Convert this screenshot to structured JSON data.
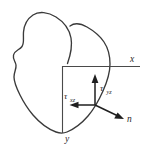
{
  "figure": {
    "background_color": "#ffffff",
    "outline_color": "#3a3a3a",
    "axis_color": "#4a4a4a",
    "vector_color": "#1f1f1f",
    "label_color": "#2b2b2b",
    "width": 149,
    "height": 154
  },
  "axes": {
    "x_label": "x",
    "y_label": "y",
    "origin": {
      "x": 62,
      "y": 66
    },
    "x_axis_end": {
      "x": 140,
      "y": 66
    },
    "y_axis_end": {
      "x": 62,
      "y": 133
    }
  },
  "vectors": [
    {
      "name": "normal-vector",
      "label": "n",
      "label_sub": "",
      "direction": "down-right",
      "from": {
        "x": 95,
        "y": 105
      },
      "to": {
        "x": 124,
        "y": 119
      }
    },
    {
      "name": "tau-yz-vector",
      "label": "τ",
      "label_sub": "yz",
      "direction": "up",
      "from": {
        "x": 95,
        "y": 105
      },
      "to": {
        "x": 95,
        "y": 76
      }
    },
    {
      "name": "tau-xz-vector",
      "label": "τ",
      "label_sub": "xz",
      "direction": "left",
      "from": {
        "x": 95,
        "y": 105
      },
      "to": {
        "x": 70,
        "y": 105
      }
    }
  ],
  "labels": {
    "x": "x",
    "y": "y",
    "n": "n",
    "tau_glyph": "τ",
    "tau_yz_sub": "yz",
    "tau_xz_sub": "xz"
  },
  "shapes": {
    "blob_name": "cross-section-outline",
    "blob_path": "M 68 64 C 70 52 72 40 66 30 C 60 20 50 12 40 14 C 30 16 24 24 22 32 C 20 40 22 46 20 50 C 18 53 14 54 13 58 C 12 62 15 64 16 68 C 17 74 14 78 14 84 C 14 92 18 98 22 104 C 26 110 31 116 38 122 C 45 128 54 133 62 133 C 70 133 78 128 86 121 C 94 114 100 106 104 96 C 108 86 110 76 110 68 C 110 60 108 52 104 46 C 100 40 94 34 88 30 C 82 26 76 24 70 26"
  }
}
